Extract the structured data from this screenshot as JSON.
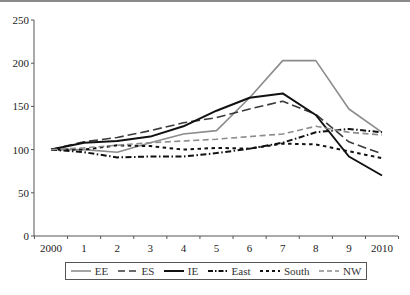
{
  "chart_data": {
    "type": "line",
    "title": "",
    "xlabel": "",
    "ylabel": "",
    "ylim": [
      0,
      250
    ],
    "yticks": [
      0,
      50,
      100,
      150,
      200,
      250
    ],
    "categories": [
      "2000",
      "1",
      "2",
      "3",
      "4",
      "5",
      "6",
      "7",
      "8",
      "9",
      "2010"
    ],
    "grid": false,
    "legend_position": "bottom",
    "series": [
      {
        "name": "EE",
        "color": "#8c8c8c",
        "dash": "solid",
        "width": 1.6,
        "values": [
          100,
          100,
          97,
          108,
          118,
          122,
          160,
          203,
          203,
          147,
          120
        ]
      },
      {
        "name": "ES",
        "color": "#3a3a3a",
        "dash": "long",
        "width": 1.6,
        "values": [
          100,
          109,
          114,
          122,
          131,
          137,
          147,
          156,
          141,
          109,
          95
        ]
      },
      {
        "name": "IE",
        "color": "#111111",
        "dash": "solid",
        "width": 2,
        "values": [
          100,
          108,
          110,
          115,
          127,
          145,
          160,
          165,
          140,
          92,
          70
        ]
      },
      {
        "name": "East",
        "color": "#111111",
        "dash": "dashdot",
        "width": 2,
        "values": [
          100,
          97,
          91,
          92,
          92,
          96,
          101,
          108,
          120,
          124,
          120
        ]
      },
      {
        "name": "South",
        "color": "#111111",
        "dash": "short",
        "width": 2,
        "values": [
          100,
          100,
          105,
          104,
          100,
          102,
          101,
          107,
          106,
          98,
          90
        ]
      },
      {
        "name": "NW",
        "color": "#8c8c8c",
        "dash": "medium",
        "width": 1.6,
        "values": [
          100,
          102,
          105,
          108,
          110,
          112,
          115,
          118,
          127,
          120,
          117
        ]
      }
    ]
  },
  "legend": {
    "items": [
      "EE",
      "ES",
      "IE",
      "East",
      "South",
      "NW"
    ]
  }
}
